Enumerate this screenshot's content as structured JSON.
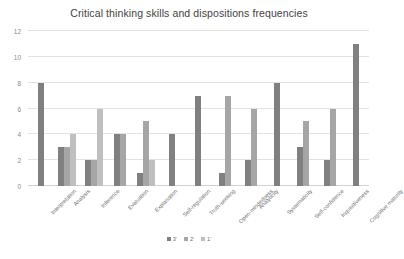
{
  "chart_data": {
    "type": "bar",
    "title": "Critical thinking skills and dispositions frequencies",
    "xlabel": "",
    "ylabel": "",
    "ylim": [
      0,
      12
    ],
    "yticks": [
      0,
      2,
      4,
      6,
      8,
      10,
      12
    ],
    "grid": true,
    "legend_position": "bottom",
    "categories": [
      "Interpretation",
      "Analysis",
      "Inference",
      "Evaluation",
      "Explanation",
      "Self-regulation",
      "Truth-seeking",
      "Open-mindedness",
      "Analyticity",
      "Systematicity",
      "Self-confidence",
      "Inquisitiveness",
      "Cognitive maturity"
    ],
    "series": [
      {
        "name": "3'",
        "color": "#808080",
        "values": [
          8,
          3,
          2,
          4,
          1,
          4,
          7,
          1,
          2,
          8,
          3,
          2,
          11
        ]
      },
      {
        "name": "2'",
        "color": "#a6a6a6",
        "values": [
          null,
          3,
          2,
          4,
          5,
          null,
          null,
          7,
          6,
          null,
          5,
          6,
          null
        ]
      },
      {
        "name": "1'",
        "color": "#bfbfbf",
        "values": [
          null,
          4,
          6,
          null,
          2,
          null,
          null,
          null,
          null,
          null,
          null,
          null,
          null
        ]
      }
    ]
  },
  "legend": {
    "items": [
      {
        "label": "3'",
        "color": "#808080"
      },
      {
        "label": "2'",
        "color": "#a6a6a6"
      },
      {
        "label": "1'",
        "color": "#bfbfbf"
      }
    ]
  }
}
